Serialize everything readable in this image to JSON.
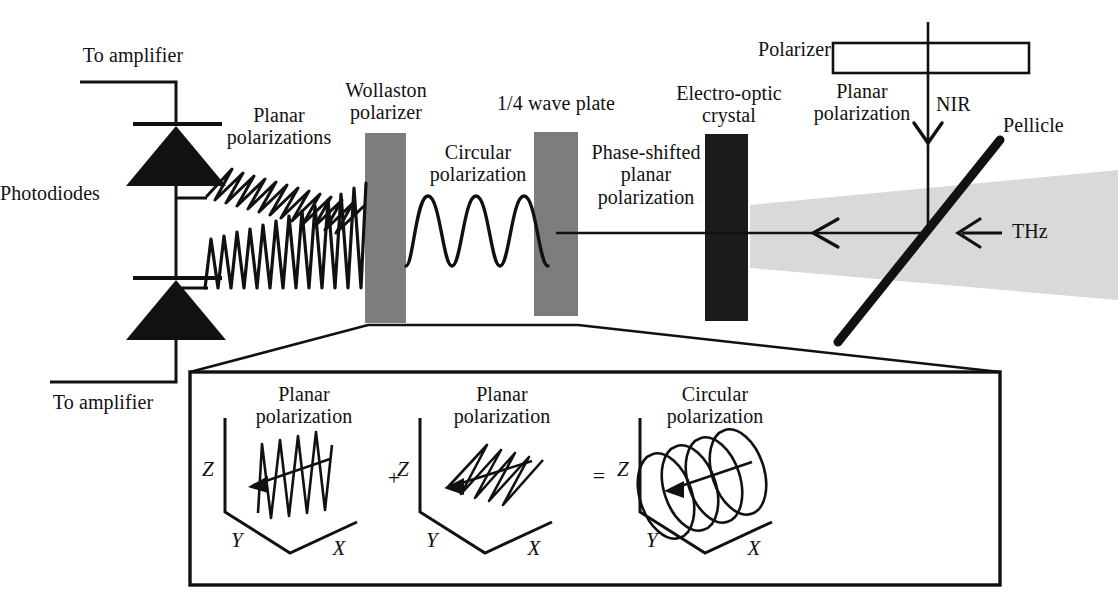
{
  "figure": {
    "colors": {
      "ink": "#111111",
      "wave_plate_gray": "#7d7d7d",
      "crystal_black": "#1b1b1b",
      "thz_beam_gray": "#d9d9d9",
      "pellicle_black": "#111111",
      "background": "#ffffff"
    }
  },
  "labels": {
    "to_amplifier_top": "To amplifier",
    "to_amplifier_bottom": "To amplifier",
    "photodiodes": "Photodiodes",
    "planar_polarizations": "Planar\npolarizations",
    "wollaston_polarizer": "Wollaston\npolarizer",
    "circular_polarization": "Circular\npolarization",
    "quarter_wave_plate": "1/4 wave plate",
    "phase_shifted_planar_polarization": "Phase-shifted\nplanar\npolarization",
    "electro_optic_crystal": "Electro-optic\ncrystal",
    "polarizer": "Polarizer",
    "planar_polarization_right": "Planar\npolarization",
    "nir": "NIR",
    "pellicle": "Pellicle",
    "thz": "THz"
  },
  "inset": {
    "panels": [
      {
        "id": "panel-planar-vertical",
        "caption": "Planar\npolarization",
        "axes": {
          "z": "Z",
          "y": "Y",
          "x": "X"
        },
        "wave_type": "vertical-planar"
      },
      {
        "id": "panel-planar-horizontal",
        "caption": "Planar\npolarization",
        "axes": {
          "z": "Z",
          "y": "Y",
          "x": "X"
        },
        "wave_type": "horizontal-planar"
      },
      {
        "id": "panel-circular",
        "caption": "Circular\npolarization",
        "axes": {
          "z": "Z",
          "y": "Y",
          "x": "X"
        },
        "wave_type": "circular-helix"
      }
    ],
    "operators": {
      "plus": "+",
      "equals": "="
    }
  },
  "components": [
    {
      "name": "wollaston-polarizer",
      "kind": "gray-plate"
    },
    {
      "name": "quarter-wave-plate",
      "kind": "gray-plate"
    },
    {
      "name": "electro-optic-crystal",
      "kind": "black-plate"
    },
    {
      "name": "polarizer",
      "kind": "outline-box"
    },
    {
      "name": "pellicle",
      "kind": "thick-diagonal-line"
    },
    {
      "name": "photodiode-top",
      "kind": "diode-symbol"
    },
    {
      "name": "photodiode-bottom",
      "kind": "diode-symbol"
    }
  ]
}
